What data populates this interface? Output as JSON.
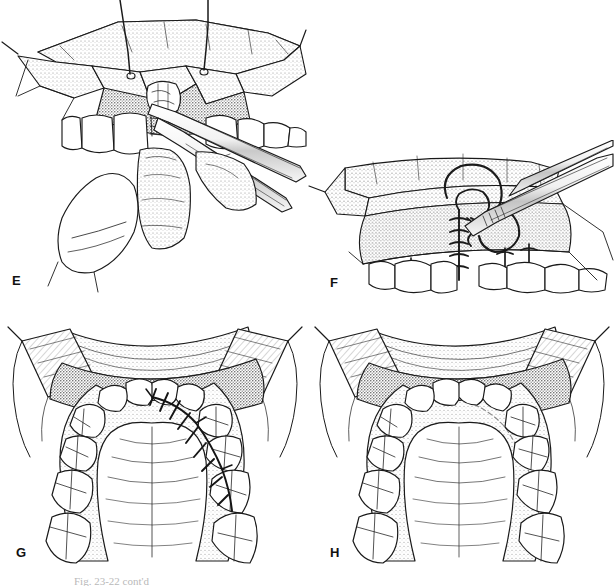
{
  "figure": {
    "style": "pen-and-ink line drawing with stipple shading",
    "background_color": "#ffffff",
    "ink_color": "#1a1a1a",
    "shade_color": "#8d8d8d",
    "panel_count": 4,
    "clipped_caption": "Fig. 23-22 cont'd"
  },
  "panels": [
    {
      "label": "E",
      "view": "intraoral anterior view, mucoperiosteal flap retracted",
      "description": "Labial flap elevated and held by two traction sutures; bone graft placed into alveolar cleft defect; periosteal elevator and forceps in field; lower lip and tongue retracted inferiorly.",
      "elements": [
        "retracted-labial-flap",
        "traction-suture-left",
        "traction-suture-right",
        "alveolar-cleft-defect",
        "cancellous-bone-graft",
        "periosteal-elevator",
        "tissue-forceps",
        "maxillary-incisors",
        "lower-lip",
        "tongue"
      ]
    },
    {
      "label": "F",
      "view": "intraoral anterior view, flap closure",
      "description": "Flap advanced and sutured with interrupted sutures along the vertical incision line; curved needle grasped by needle holder; suture loop being drawn through tissue; additional interrupted sutures lateral to the cleft.",
      "elements": [
        "advanced-flap",
        "needle-holder",
        "curved-needle",
        "suture-loop",
        "interrupted-suture-line",
        "lateral-interrupted-sutures",
        "maxillary-incisors"
      ]
    },
    {
      "label": "G",
      "view": "occlusal (palatal) view, immediately after closure",
      "description": "Maxillary arch seen from below with cheek retractors and gauze at each commissure; palatal flap sutured closed with a running line of interrupted sutures crossing the left alveolar region; palatal rugae stippled.",
      "elements": [
        "cheek-retractor-left",
        "cheek-retractor-right",
        "gauze-pack-left",
        "gauze-pack-right",
        "maxillary-dental-arch",
        "palatal-mucosa",
        "palatal-rugae",
        "palatal-suture-line",
        "upper-lip"
      ]
    },
    {
      "label": "H",
      "view": "occlusal (palatal) view, healed result",
      "description": "Same palatal exposure after healing; sutures removed, continuous intact palatal mucosa with faint scar line, arch form restored.",
      "elements": [
        "cheek-retractor-left",
        "cheek-retractor-right",
        "gauze-pack-left",
        "gauze-pack-right",
        "maxillary-dental-arch",
        "healed-palatal-mucosa",
        "faint-scar-line",
        "palatal-rugae",
        "upper-lip"
      ]
    }
  ]
}
